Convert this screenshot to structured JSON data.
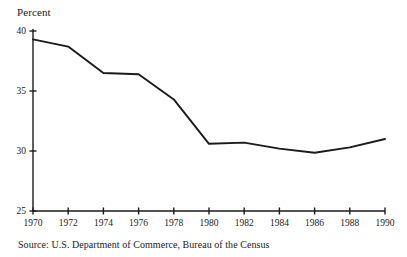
{
  "figure": {
    "axis_label": "Percent",
    "source": "Source: U.S. Department of Commerce, Bureau of the Census",
    "line_color": "#1a1a1a",
    "axis_color": "#1a1a1a",
    "background": "#ffffff"
  },
  "chart_data": {
    "type": "line",
    "title": "",
    "subtitle": "",
    "xlabel": "",
    "ylabel": "Percent",
    "x": [
      1970,
      1972,
      1974,
      1976,
      1978,
      1980,
      1982,
      1984,
      1986,
      1988,
      1990
    ],
    "values": [
      39.3,
      38.7,
      36.5,
      36.4,
      34.3,
      30.6,
      30.7,
      30.2,
      29.85,
      30.3,
      31.0
    ],
    "xtick_labels": [
      "1970",
      "1972",
      "1974",
      "1976",
      "1978",
      "1980",
      "1982",
      "1984",
      "1986",
      "1988",
      "1990"
    ],
    "ytick_labels": [
      "25",
      "30",
      "35",
      "40"
    ],
    "yticks": [
      25,
      30,
      35,
      40
    ],
    "xlim": [
      1970,
      1990
    ],
    "ylim": [
      25,
      40
    ],
    "grid": false,
    "legend": false,
    "legend_position": "none",
    "annotations": [
      "Source: U.S. Department of Commerce, Bureau of the Census"
    ]
  }
}
